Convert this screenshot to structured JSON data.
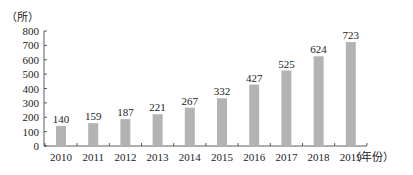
{
  "chart_data": {
    "type": "bar",
    "title": "",
    "xlabel": "（年份）",
    "ylabel": "（所）",
    "categories": [
      "2010",
      "2011",
      "2012",
      "2013",
      "2014",
      "2015",
      "2016",
      "2017",
      "2018",
      "2019"
    ],
    "values": [
      140,
      159,
      187,
      221,
      267,
      332,
      427,
      525,
      624,
      723
    ],
    "data_labels": [
      "140",
      "159",
      "187",
      "221",
      "267",
      "332",
      "427",
      "525",
      "624",
      "723"
    ],
    "ylim": [
      0,
      800
    ],
    "yticks": [
      0,
      100,
      200,
      300,
      400,
      500,
      600,
      700,
      800
    ],
    "grid": false,
    "legend": null,
    "bar_color": "#b3b3b3"
  }
}
